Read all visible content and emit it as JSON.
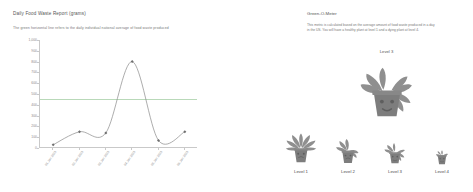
{
  "report": {
    "title": "Daily Food Waste Report (grams)",
    "subtitle": "The green horizontal line refers to the daily individual national average of food waste produced"
  },
  "greenometer": {
    "title": "Green-O-Meter",
    "description": "This metric is calculated based on the average amount of food waste produced in a day in the US. You will have a healthy plant at level 1 and a dying plant at level 4.",
    "current_level_label": "Level 3",
    "current_level": 3,
    "scale": [
      {
        "label": "Level 1",
        "state": "healthy"
      },
      {
        "label": "Level 2",
        "state": "slightly-wilted"
      },
      {
        "label": "Level 3",
        "state": "wilted"
      },
      {
        "label": "Level 4",
        "state": "dying"
      }
    ],
    "colors": {
      "plant": "#8c8c8c",
      "pot": "#7d7d7d"
    }
  },
  "chart_data": {
    "type": "line",
    "title": "Daily Food Waste Report (grams)",
    "subtitle": "The green horizontal line refers to the daily individual national average of food waste produced",
    "xlabel": "",
    "ylabel": "",
    "categories": [
      "01 Jan 2023",
      "02 Jan 2023",
      "03 Jan 2023",
      "04 Jan 2023",
      "05 Jan 2023",
      "06 Jan 2023"
    ],
    "values": [
      30,
      150,
      140,
      800,
      70,
      150
    ],
    "ylim": [
      0,
      1000
    ],
    "yticks": [
      0,
      100,
      200,
      300,
      400,
      500,
      600,
      700,
      800,
      900,
      1000
    ],
    "ytick_labels": [
      "0",
      "100",
      "200",
      "300",
      "400",
      "500",
      "600",
      "700",
      "800",
      "900",
      "1,000"
    ],
    "grid": false,
    "legend": false,
    "reference_line": {
      "value": 450,
      "label": "National daily average",
      "color": "#b9d9b9"
    },
    "series_color": "#8a8a8a",
    "marker": "diamond"
  }
}
